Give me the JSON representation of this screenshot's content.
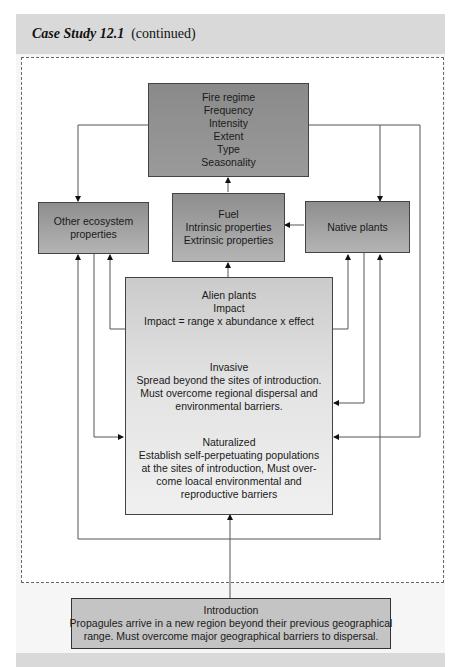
{
  "header": {
    "title_bold": "Case Study 12.1",
    "title_rest": "(continued)"
  },
  "diagram": {
    "fire_regime": {
      "lines": [
        "Fire regime",
        "Frequency",
        "Intensity",
        "Extent",
        "Type",
        "Seasonality"
      ]
    },
    "other_ecosystem": {
      "lines": [
        "Other ecosystem",
        "properties"
      ]
    },
    "fuel": {
      "lines": [
        "Fuel",
        "Intrinsic properties",
        "Extrinsic properties"
      ]
    },
    "native_plants": {
      "lines": [
        "Native plants"
      ]
    },
    "alien_plants": {
      "impact": [
        "Alien plants",
        "Impact",
        "Impact = range x abundance x effect"
      ],
      "invasive": [
        "Invasive",
        "Spread beyond the sites of introduction.",
        "Must overcome regional dispersal and",
        "environmental barriers."
      ],
      "naturalized": [
        "Naturalized",
        "Establish self-perpetuating populations",
        "at the sites of introduction, Must over-",
        "come loacal environmental and",
        "reproductive barriers"
      ]
    },
    "introduction": {
      "lines": [
        "Introduction",
        "Propagules arrive in a new region beyond their previous geographical",
        "range. Must overcome major geographical barriers to dispersal."
      ]
    }
  },
  "colors": {
    "dark_box": "#8c8c8c",
    "header_band": "#d9d9d9",
    "line": "#555555"
  }
}
